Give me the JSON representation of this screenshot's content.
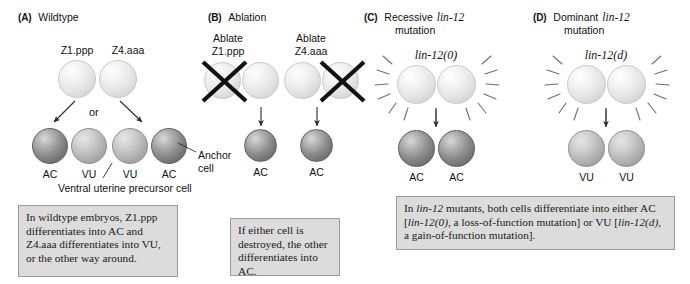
{
  "figure": {
    "panels": [
      {
        "letter": "(A)",
        "title": "Wildtype",
        "title_line2": "",
        "top_cells": [
          {
            "name": "Z1.ppp",
            "type": "precursor"
          },
          {
            "name": "Z4.aaa",
            "type": "precursor"
          }
        ],
        "connector_word": "or",
        "outcome_labels": [
          "AC",
          "VU",
          "VU",
          "AC"
        ],
        "annotations": [
          {
            "name": "anchor-cell",
            "text_line1": "Anchor",
            "text_line2": "cell"
          },
          {
            "name": "ventral-uterine-precursor-cell",
            "text": "Ventral uterine precursor cell"
          }
        ],
        "caption": "In wildtype embryos, Z1.ppp differentiates into AC and Z4.aaa differentiates into VU, or the other way around."
      },
      {
        "letter": "(B)",
        "title": "Ablation",
        "title_line2": "",
        "top_cells": [
          {
            "name": "Ablate Z1.ppp",
            "line1": "Ablate",
            "line2": "Z1.ppp",
            "ablated": true
          },
          {
            "name": "Ablate Z4.aaa",
            "line1": "Ablate",
            "line2": "Z4.aaa",
            "ablated": true
          }
        ],
        "outcome_labels": [
          "AC",
          "AC"
        ],
        "caption": "If either cell is destroyed, the other differentiates into AC."
      },
      {
        "letter": "(C)",
        "title": "Recessive lin-12",
        "title_gene": "lin-12",
        "title_prefix": "Recessive",
        "title_line2": "mutation",
        "genotype": "lin-12(0)",
        "outcome_labels": [
          "AC",
          "AC"
        ]
      },
      {
        "letter": "(D)",
        "title": "Dominant lin-12",
        "title_gene": "lin-12",
        "title_prefix": "Dominant",
        "title_line2": "mutation",
        "genotype": "lin-12(d)",
        "outcome_labels": [
          "VU",
          "VU"
        ]
      }
    ],
    "caption_cd": {
      "part1": "In ",
      "gene1": "lin-12",
      "part2": " mutants, both cells differentiate into either AC [",
      "gene2": "lin-12(0)",
      "part3": ", a loss-of-function mutation] or VU [",
      "gene3": "lin-12(d)",
      "part4": ", a gain-of-function mutation]."
    },
    "colors": {
      "precursor_cell": "#e9e9e9",
      "vu_cell": "#b4b4b4",
      "ac_cell": "#8b8b8b",
      "caption_bg": "#dcdcdc",
      "caption_border": "#9b9b9b",
      "ink": "#111111"
    }
  }
}
